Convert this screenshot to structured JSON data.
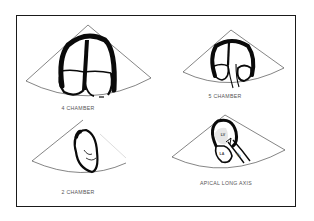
{
  "figure": {
    "type": "echocardiography apical views schematic",
    "colors": {
      "background": "#ffffff",
      "frame": "#1a1a1a",
      "wall": "#0a0a0a",
      "sector_line": "#333333",
      "label": "#555555"
    },
    "views": [
      {
        "id": "four-chamber",
        "label": "4 CHAMBER"
      },
      {
        "id": "five-chamber",
        "label": "5 CHAMBER"
      },
      {
        "id": "two-chamber",
        "label": "2 CHAMBER"
      },
      {
        "id": "apical-long-axis",
        "label": "APICAL LONG AXIS",
        "structures": {
          "lv": "LV",
          "la": "LA",
          "ao": "AO"
        }
      }
    ]
  }
}
